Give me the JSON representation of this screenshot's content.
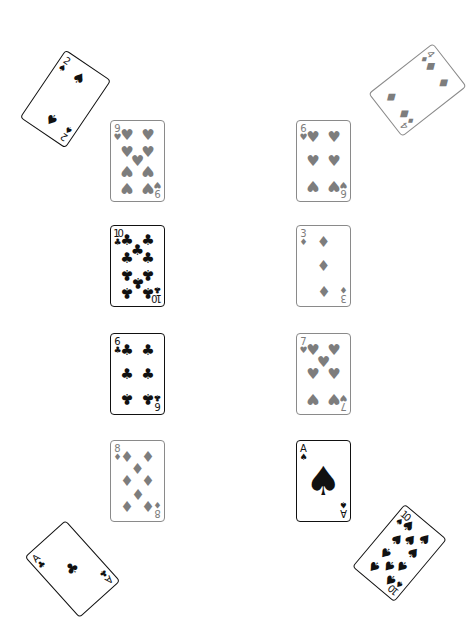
{
  "table": {
    "background": "#ffffff",
    "faded_color": "#7d7d7d",
    "dark_color": "#111111"
  },
  "cards": [
    {
      "id": "corner-top-left",
      "rank": "2",
      "suit": "spades",
      "suit_glyph": "♠",
      "x": 38,
      "y": 58,
      "rotation": -146,
      "style": "dark"
    },
    {
      "id": "corner-top-right",
      "rank": "4",
      "suit": "diamonds",
      "suit_glyph": "♦",
      "x": 390,
      "y": 49,
      "rotation": -128,
      "style": "faded"
    },
    {
      "id": "left-1",
      "rank": "9",
      "suit": "hearts",
      "suit_glyph": "♥",
      "x": 110,
      "y": 120,
      "rotation": 0,
      "style": "faded"
    },
    {
      "id": "left-2",
      "rank": "10",
      "suit": "clubs",
      "suit_glyph": "♣",
      "x": 110,
      "y": 225,
      "rotation": 0,
      "style": "dark"
    },
    {
      "id": "left-3",
      "rank": "6",
      "suit": "clubs",
      "suit_glyph": "♣",
      "x": 110,
      "y": 333,
      "rotation": 0,
      "style": "dark"
    },
    {
      "id": "left-4",
      "rank": "8",
      "suit": "diamonds",
      "suit_glyph": "♦",
      "x": 110,
      "y": 440,
      "rotation": 0,
      "style": "faded"
    },
    {
      "id": "right-1",
      "rank": "6",
      "suit": "hearts",
      "suit_glyph": "♥",
      "x": 296,
      "y": 120,
      "rotation": 0,
      "style": "faded"
    },
    {
      "id": "right-2",
      "rank": "3",
      "suit": "diamonds",
      "suit_glyph": "♦",
      "x": 296,
      "y": 225,
      "rotation": 0,
      "style": "faded"
    },
    {
      "id": "right-3",
      "rank": "7",
      "suit": "hearts",
      "suit_glyph": "♥",
      "x": 296,
      "y": 333,
      "rotation": 0,
      "style": "faded"
    },
    {
      "id": "right-4",
      "rank": "A",
      "suit": "spades",
      "suit_glyph": "♠",
      "x": 296,
      "y": 440,
      "rotation": 0,
      "style": "dark"
    },
    {
      "id": "corner-bottom-left",
      "rank": "A",
      "suit": "clubs",
      "suit_glyph": "♣",
      "x": 45,
      "y": 528,
      "rotation": -42,
      "style": "dark"
    },
    {
      "id": "corner-bottom-right",
      "rank": "10",
      "suit": "spades",
      "suit_glyph": "♠",
      "x": 372,
      "y": 512,
      "rotation": 40,
      "style": "dark"
    }
  ]
}
